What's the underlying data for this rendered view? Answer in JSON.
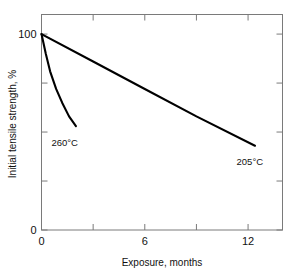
{
  "chart_data": {
    "type": "line",
    "title": "",
    "xlabel": "Exposure, months",
    "ylabel": "Initial tensile strength, %",
    "xlim": [
      0,
      14
    ],
    "ylim": [
      0,
      110
    ],
    "grid": false,
    "legend_position": "inline-annotations",
    "x_ticks_major": [
      0,
      6,
      12
    ],
    "x_ticks_major_labels": [
      "0",
      "6",
      "12"
    ],
    "x_ticks_minor": [
      3,
      9
    ],
    "y_ticks_major": [
      0,
      100
    ],
    "y_ticks_major_labels": [
      "0",
      "100"
    ],
    "y_ticks_minor": [
      25,
      50,
      75
    ],
    "series": [
      {
        "name": "260°C",
        "label": "260°C",
        "color": "#000000",
        "points": [
          {
            "x": 0.0,
            "y": 100
          },
          {
            "x": 0.25,
            "y": 90
          },
          {
            "x": 0.5,
            "y": 81
          },
          {
            "x": 0.85,
            "y": 72
          },
          {
            "x": 1.2,
            "y": 65
          },
          {
            "x": 1.6,
            "y": 58
          },
          {
            "x": 2.0,
            "y": 53
          }
        ],
        "annotation": {
          "x": 1.35,
          "y": 43
        }
      },
      {
        "name": "205°C",
        "label": "205°C",
        "color": "#000000",
        "points": [
          {
            "x": 0.0,
            "y": 100
          },
          {
            "x": 3.0,
            "y": 86
          },
          {
            "x": 6.0,
            "y": 72
          },
          {
            "x": 9.0,
            "y": 58
          },
          {
            "x": 12.4,
            "y": 43
          }
        ],
        "annotation": {
          "x": 12.1,
          "y": 33
        }
      }
    ]
  },
  "figure": {
    "background_color": "#ffffff",
    "frame_color": "#7a7a7a",
    "line_color": "#000000"
  }
}
